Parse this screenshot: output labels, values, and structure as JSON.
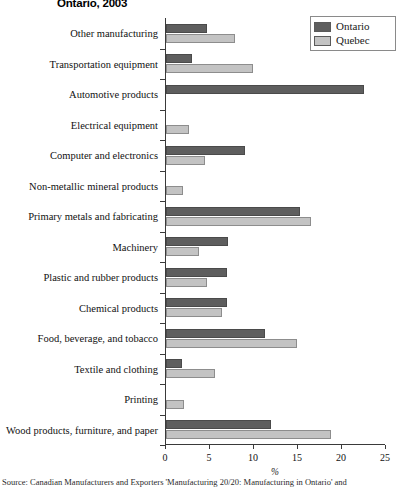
{
  "title": "Ontario, 2003",
  "legend": {
    "position": "top-right",
    "entries": [
      {
        "label": "Ontario",
        "color": "#5e5e5e"
      },
      {
        "label": "Quebec",
        "color": "#c3c3c3"
      }
    ]
  },
  "source_note": "Source: Canadian Manufacturers and Exporters 'Manufacturing 20/20: Manufacturing in Ontario' and",
  "source_prefix": "Source:",
  "chart_data": {
    "type": "bar",
    "orientation": "horizontal",
    "title": "Ontario, 2003",
    "xlabel": "%",
    "ylabel": "",
    "xlim": [
      0,
      25
    ],
    "xticks": [
      0,
      5,
      10,
      15,
      20,
      25
    ],
    "grid": false,
    "legend_position": "top-right",
    "categories": [
      "Other manufacturing",
      "Transportation equipment",
      "Automotive products",
      "Electrical equipment",
      "Computer and electronics",
      "Non-metallic mineral products",
      "Primary metals and fabricating",
      "Machinery",
      "Plastic and rubber products",
      "Chemical products",
      "Food, beverage, and tobacco",
      "Textile and clothing",
      "Printing",
      "Wood products, furniture, and paper"
    ],
    "series": [
      {
        "name": "Ontario",
        "color": "#5e5e5e",
        "values": [
          4.7,
          2.9,
          22.5,
          0.0,
          9.0,
          0.0,
          15.2,
          7.0,
          6.9,
          6.9,
          11.2,
          1.8,
          0.0,
          11.9
        ]
      },
      {
        "name": "Quebec",
        "color": "#c3c3c3",
        "values": [
          7.8,
          9.9,
          0.0,
          2.6,
          4.4,
          1.9,
          16.5,
          3.7,
          4.7,
          6.4,
          14.9,
          5.6,
          2.1,
          18.8
        ]
      }
    ]
  }
}
